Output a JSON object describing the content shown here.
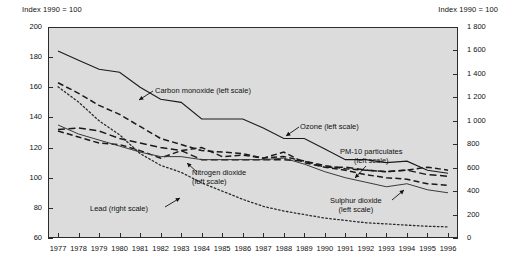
{
  "header": {
    "left_label": "Index 1990 = 100",
    "right_label": "Index 1990 = 100"
  },
  "chart_data": {
    "type": "line",
    "title": "",
    "xlabel": "",
    "ylabel": "Index 1990 = 100",
    "y2label": "Index 1990 = 100",
    "grid": false,
    "legend_position": "inline-annotations",
    "x": [
      1977,
      1978,
      1979,
      1980,
      1981,
      1982,
      1983,
      1984,
      1985,
      1986,
      1987,
      1988,
      1989,
      1990,
      1991,
      1992,
      1993,
      1994,
      1995,
      1996
    ],
    "xtick_labels": [
      "1977",
      "1978",
      "1979",
      "1980",
      "1981",
      "1982",
      "1983",
      "1984",
      "1985",
      "1986",
      "1987",
      "1988",
      "1989",
      "1990",
      "1991",
      "1992",
      "1993",
      "1994",
      "1995",
      "1996"
    ],
    "ylim": [
      60,
      200
    ],
    "ytick_labels": [
      "60",
      "80",
      "100",
      "120",
      "140",
      "160",
      "180",
      "200"
    ],
    "ytick_values": [
      60,
      80,
      100,
      120,
      140,
      160,
      180,
      200
    ],
    "y2lim": [
      0,
      1800
    ],
    "y2tick_labels": [
      "0",
      "200",
      "400",
      "600",
      "800",
      "1 000",
      "1 200",
      "1 400",
      "1 600",
      "1 800"
    ],
    "y2tick_values": [
      0,
      200,
      400,
      600,
      800,
      1000,
      1200,
      1400,
      1600,
      1800
    ],
    "series": [
      {
        "name": "Carbon monoxide (left scale)",
        "axis": "left",
        "style": "solid",
        "values": [
          184,
          178,
          172,
          170,
          160,
          152,
          150,
          139,
          139,
          139,
          133,
          126,
          126,
          119,
          112,
          112,
          110,
          111,
          105,
          103
        ]
      },
      {
        "name": "Ozone (left scale)",
        "axis": "left",
        "style": "dashed",
        "values": [
          163,
          156,
          148,
          142,
          134,
          126,
          122,
          118,
          117,
          116,
          113,
          117,
          110,
          107,
          105,
          102,
          100,
          99,
          96,
          95
        ]
      },
      {
        "name": "Nitrogen dioxide (left scale)",
        "axis": "left",
        "style": "long-dash",
        "values": [
          132,
          133,
          131,
          126,
          123,
          120,
          118,
          112,
          112,
          112,
          112,
          112,
          111,
          107,
          107,
          105,
          104,
          105,
          102,
          101
        ]
      },
      {
        "name": "PM-10 particulates (left scale)",
        "axis": "left",
        "style": "dashed",
        "values": [
          131,
          127,
          123,
          122,
          118,
          113,
          118,
          120,
          114,
          115,
          113,
          114,
          111,
          108,
          106,
          105,
          104,
          105,
          107,
          105
        ]
      },
      {
        "name": "Sulphur dioxide (left scale)",
        "axis": "left",
        "style": "thin-solid",
        "values": [
          135,
          129,
          125,
          121,
          117,
          114,
          114,
          112,
          112,
          112,
          112,
          113,
          109,
          104,
          100,
          97,
          94,
          96,
          92,
          90
        ]
      },
      {
        "name": "Lead (right scale)",
        "axis": "right",
        "style": "dotted",
        "values": [
          1290,
          1160,
          1000,
          880,
          720,
          620,
          560,
          470,
          400,
          330,
          270,
          230,
          200,
          170,
          150,
          130,
          120,
          110,
          100,
          95
        ]
      }
    ],
    "annotations": [
      {
        "text": "Carbon monoxide (left scale)",
        "target_series": "Carbon monoxide (left scale)"
      },
      {
        "text": "Ozone (left scale)",
        "target_series": "Ozone (left scale)"
      },
      {
        "text": "PM-10 particulates",
        "text2": "(left scale)",
        "target_series": "PM-10 particulates (left scale)"
      },
      {
        "text": "Nitrogen dioxide",
        "text2": "(left scale)",
        "target_series": "Nitrogen dioxide (left scale)"
      },
      {
        "text": "Sulphur dioxide",
        "text2": "(left scale)",
        "target_series": "Sulphur dioxide (left scale)"
      },
      {
        "text": "Lead (right scale)",
        "target_series": "Lead (right scale)"
      }
    ]
  }
}
